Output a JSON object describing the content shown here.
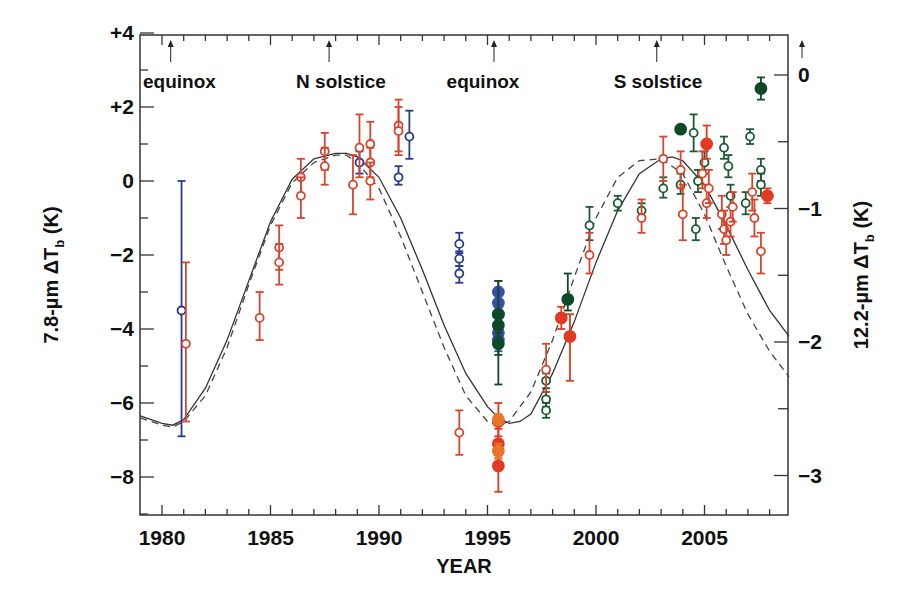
{
  "chart_data": {
    "type": "scatter",
    "title": "",
    "xlabel": "YEAR",
    "ylabel": "7.8-µm ΔT_b (K)",
    "ylabel_right": "12.2-µm ΔT_b (K)",
    "xlim": [
      1979,
      2008.9
    ],
    "ylim": [
      -9,
      4
    ],
    "ylim_right": [
      -3.3,
      0.3
    ],
    "grid": false,
    "legend": null,
    "x_ticks": [
      1980,
      1985,
      1990,
      1995,
      2000,
      2005
    ],
    "x_tick_labels": [
      "1980",
      "1985",
      "1990",
      "1995",
      "2000",
      "2005"
    ],
    "y_ticks": [
      4,
      2,
      0,
      -2,
      -4,
      -6,
      -8
    ],
    "y_tick_labels": [
      "+4",
      "+2",
      "0",
      "-2",
      "-4",
      "-6",
      "-8"
    ],
    "y_right_ticks": [
      0,
      -1,
      -2,
      -3
    ],
    "y_right_tick_labels": [
      "0",
      "-1",
      "-2",
      "-3"
    ],
    "annotations": [
      {
        "text": "equinox",
        "x": 1980.4,
        "arrow_x": 1980.4
      },
      {
        "text": "N solstice",
        "x": 1987.7,
        "arrow_x": 1987.7
      },
      {
        "text": "equinox",
        "x": 1995.3,
        "arrow_x": 1995.3
      },
      {
        "text": "S solstice",
        "x": 2002.8,
        "arrow_x": 2002.8
      }
    ],
    "curves": [
      {
        "name": "model-solid",
        "style": "solid",
        "color": "#333333",
        "x": [
          1979.0,
          1980.0,
          1980.5,
          1981.0,
          1982.0,
          1983.0,
          1984.0,
          1985.0,
          1986.0,
          1987.0,
          1988.0,
          1988.5,
          1989.0,
          1990.0,
          1991.0,
          1992.0,
          1993.0,
          1994.0,
          1995.0,
          1995.5,
          1996.0,
          1996.5,
          1997.0,
          1998.0,
          1999.0,
          2000.0,
          2001.0,
          2002.0,
          2003.0,
          2003.5,
          2004.0,
          2005.0,
          2006.0,
          2007.0,
          2008.0,
          2008.9
        ],
        "y": [
          -6.35,
          -6.55,
          -6.6,
          -6.45,
          -5.6,
          -4.3,
          -2.7,
          -1.1,
          0.05,
          0.6,
          0.75,
          0.75,
          0.65,
          0.1,
          -1.0,
          -2.4,
          -3.9,
          -5.2,
          -6.1,
          -6.4,
          -6.55,
          -6.5,
          -6.3,
          -5.2,
          -3.8,
          -2.2,
          -0.8,
          0.2,
          0.6,
          0.65,
          0.55,
          -0.1,
          -1.2,
          -2.4,
          -3.5,
          -4.2
        ]
      },
      {
        "name": "model-dashed",
        "style": "dashed",
        "color": "#444444",
        "x": [
          1979.0,
          1980.0,
          1980.5,
          1981.0,
          1982.0,
          1983.0,
          1984.0,
          1985.0,
          1986.0,
          1987.0,
          1988.0,
          1988.5,
          1989.0,
          1990.0,
          1991.0,
          1992.0,
          1993.0,
          1994.0,
          1995.0,
          1995.5,
          1996.0,
          1997.0,
          1998.0,
          1999.0,
          2000.0,
          2001.0,
          2002.0,
          2003.0,
          2004.0,
          2005.0,
          2006.0,
          2007.0,
          2008.0,
          2008.9
        ],
        "y": [
          -6.4,
          -6.6,
          -6.65,
          -6.5,
          -5.8,
          -4.5,
          -2.8,
          -1.2,
          -0.05,
          0.5,
          0.7,
          0.7,
          0.5,
          -0.2,
          -1.5,
          -3.0,
          -4.5,
          -5.8,
          -6.5,
          -6.6,
          -6.5,
          -5.7,
          -4.3,
          -2.6,
          -1.0,
          0.1,
          0.55,
          0.6,
          0.2,
          -0.9,
          -2.3,
          -3.6,
          -4.6,
          -5.3
        ]
      }
    ],
    "series": [
      {
        "name": "blue-open",
        "color": "#2a3a8c",
        "marker": "open-circle",
        "points": [
          {
            "x": 1980.9,
            "y": -3.5,
            "lo": -6.9,
            "hi": 0.0
          },
          {
            "x": 1989.1,
            "y": 0.5,
            "lo": 0.2,
            "hi": 0.8
          },
          {
            "x": 1990.9,
            "y": 0.1,
            "lo": -0.1,
            "hi": 0.4
          },
          {
            "x": 1991.4,
            "y": 1.2,
            "lo": 0.6,
            "hi": 1.9
          },
          {
            "x": 1993.7,
            "y": -1.7,
            "lo": -1.95,
            "hi": -1.4
          },
          {
            "x": 1993.7,
            "y": -2.1,
            "lo": -2.3,
            "hi": -1.9
          },
          {
            "x": 1993.7,
            "y": -2.5,
            "lo": -2.75,
            "hi": -2.3
          }
        ]
      },
      {
        "name": "blue-filled",
        "color": "#3a4fa8",
        "marker": "filled-circle",
        "points": [
          {
            "x": 1995.5,
            "y": -3.0,
            "lo": -3.3,
            "hi": -2.7
          },
          {
            "x": 1995.5,
            "y": -3.3,
            "lo": -3.6,
            "hi": -3.0
          },
          {
            "x": 1995.5,
            "y": -3.6,
            "lo": -3.9,
            "hi": -3.3
          },
          {
            "x": 1995.5,
            "y": -4.1,
            "lo": -4.4,
            "hi": -3.8
          },
          {
            "x": 1995.5,
            "y": -4.3,
            "lo": -4.6,
            "hi": -4.0
          }
        ]
      },
      {
        "name": "green-filled",
        "color": "#0f4a28",
        "marker": "filled-circle",
        "points": [
          {
            "x": 1995.5,
            "y": -3.6,
            "lo": -5.5,
            "hi": -2.7
          },
          {
            "x": 1995.5,
            "y": -3.9,
            "lo": -4.2,
            "hi": -3.6
          },
          {
            "x": 1995.5,
            "y": -4.4,
            "lo": -4.7,
            "hi": -4.1
          },
          {
            "x": 1998.7,
            "y": -3.2,
            "lo": -3.5,
            "hi": -2.5
          },
          {
            "x": 2003.9,
            "y": 1.4,
            "lo": 1.3,
            "hi": 1.5
          },
          {
            "x": 2007.6,
            "y": 2.5,
            "lo": 2.2,
            "hi": 2.8
          }
        ]
      },
      {
        "name": "green-open",
        "color": "#1d5a34",
        "marker": "open-circle",
        "points": [
          {
            "x": 1997.7,
            "y": -5.4,
            "lo": -5.6,
            "hi": -5.2
          },
          {
            "x": 1997.7,
            "y": -5.9,
            "lo": -6.1,
            "hi": -5.7
          },
          {
            "x": 1997.7,
            "y": -6.2,
            "lo": -6.4,
            "hi": -6.0
          },
          {
            "x": 1999.7,
            "y": -1.2,
            "lo": -1.6,
            "hi": -0.7
          },
          {
            "x": 2001.0,
            "y": -0.6,
            "lo": -0.8,
            "hi": -0.4
          },
          {
            "x": 2002.1,
            "y": -0.8,
            "lo": -1.0,
            "hi": -0.6
          },
          {
            "x": 2003.1,
            "y": -0.2,
            "lo": -0.45,
            "hi": 0.1
          },
          {
            "x": 2003.9,
            "y": -0.1,
            "lo": -0.35,
            "hi": 0.2
          },
          {
            "x": 2004.5,
            "y": 1.3,
            "lo": 0.8,
            "hi": 1.8
          },
          {
            "x": 2004.6,
            "y": -1.3,
            "lo": -1.6,
            "hi": -1.0
          },
          {
            "x": 2004.7,
            "y": 0.0,
            "lo": -0.3,
            "hi": 0.3
          },
          {
            "x": 2005.0,
            "y": 0.5,
            "lo": 0.2,
            "hi": 0.8
          },
          {
            "x": 2005.9,
            "y": 0.9,
            "lo": 0.6,
            "hi": 1.2
          },
          {
            "x": 2006.1,
            "y": 0.4,
            "lo": 0.1,
            "hi": 0.7
          },
          {
            "x": 2006.2,
            "y": -0.4,
            "lo": -0.7,
            "hi": -0.1
          },
          {
            "x": 2006.9,
            "y": -0.6,
            "lo": -0.9,
            "hi": -0.3
          },
          {
            "x": 2007.1,
            "y": 1.2,
            "lo": 1.0,
            "hi": 1.4
          },
          {
            "x": 2007.6,
            "y": 0.3,
            "lo": 0.0,
            "hi": 0.6
          },
          {
            "x": 2007.6,
            "y": -0.1,
            "lo": -0.4,
            "hi": 0.2
          }
        ]
      },
      {
        "name": "red-open",
        "color": "#d8452e",
        "marker": "open-circle",
        "points": [
          {
            "x": 1981.1,
            "y": -4.4,
            "lo": -6.5,
            "hi": -2.2
          },
          {
            "x": 1984.5,
            "y": -3.7,
            "lo": -4.3,
            "hi": -3.0
          },
          {
            "x": 1985.4,
            "y": -1.8,
            "lo": -2.4,
            "hi": -1.2
          },
          {
            "x": 1985.4,
            "y": -2.2,
            "lo": -2.8,
            "hi": -1.7
          },
          {
            "x": 1986.4,
            "y": 0.1,
            "lo": -0.4,
            "hi": 0.6
          },
          {
            "x": 1986.4,
            "y": -0.4,
            "lo": -1.0,
            "hi": 0.1
          },
          {
            "x": 1987.5,
            "y": 0.8,
            "lo": 0.3,
            "hi": 1.3
          },
          {
            "x": 1987.5,
            "y": 0.4,
            "lo": -0.1,
            "hi": 0.9
          },
          {
            "x": 1988.8,
            "y": -0.1,
            "lo": -0.9,
            "hi": 0.7
          },
          {
            "x": 1989.1,
            "y": 0.9,
            "lo": 0.1,
            "hi": 1.8
          },
          {
            "x": 1989.6,
            "y": 1.0,
            "lo": 0.5,
            "hi": 1.6
          },
          {
            "x": 1989.6,
            "y": 0.5,
            "lo": 0.1,
            "hi": 0.9
          },
          {
            "x": 1989.6,
            "y": 0.0,
            "lo": -0.5,
            "hi": 0.5
          },
          {
            "x": 1990.9,
            "y": 1.5,
            "lo": 0.8,
            "hi": 2.2
          },
          {
            "x": 1990.9,
            "y": 1.35,
            "lo": 0.7,
            "hi": 2.0
          },
          {
            "x": 1993.7,
            "y": -6.8,
            "lo": -7.4,
            "hi": -6.2
          },
          {
            "x": 1997.7,
            "y": -5.1,
            "lo": -5.7,
            "hi": -4.4
          },
          {
            "x": 1999.7,
            "y": -2.0,
            "lo": -2.5,
            "hi": -1.4
          },
          {
            "x": 2002.1,
            "y": -1.0,
            "lo": -1.4,
            "hi": -0.5
          },
          {
            "x": 2003.1,
            "y": 0.6,
            "lo": 0.0,
            "hi": 1.2
          },
          {
            "x": 2003.9,
            "y": 0.3,
            "lo": -0.2,
            "hi": 0.8
          },
          {
            "x": 2004.0,
            "y": -0.9,
            "lo": -1.6,
            "hi": -0.1
          },
          {
            "x": 2004.9,
            "y": 0.2,
            "lo": -0.2,
            "hi": 0.8
          },
          {
            "x": 2005.1,
            "y": -0.6,
            "lo": -1.0,
            "hi": -0.1
          },
          {
            "x": 2005.2,
            "y": -0.2,
            "lo": -0.6,
            "hi": 0.3
          },
          {
            "x": 2005.8,
            "y": -0.9,
            "lo": -1.3,
            "hi": -0.4
          },
          {
            "x": 2005.9,
            "y": -1.3,
            "lo": -1.7,
            "hi": -0.8
          },
          {
            "x": 2006.0,
            "y": -1.6,
            "lo": -2.0,
            "hi": -1.1
          },
          {
            "x": 2006.2,
            "y": -1.1,
            "lo": -1.5,
            "hi": -0.7
          },
          {
            "x": 2006.3,
            "y": -0.7,
            "lo": -1.1,
            "hi": -0.3
          },
          {
            "x": 2007.2,
            "y": -0.3,
            "lo": -0.8,
            "hi": 0.2
          },
          {
            "x": 2007.3,
            "y": -1.0,
            "lo": -1.5,
            "hi": -0.5
          },
          {
            "x": 2007.6,
            "y": -1.9,
            "lo": -2.5,
            "hi": -1.4
          }
        ]
      },
      {
        "name": "red-filled",
        "color": "#e03a22",
        "marker": "filled-circle",
        "points": [
          {
            "x": 1995.5,
            "y": -6.5,
            "lo": -6.9,
            "hi": -6.0
          },
          {
            "x": 1995.5,
            "y": -7.1,
            "lo": -7.5,
            "hi": -6.7
          },
          {
            "x": 1995.5,
            "y": -7.7,
            "lo": -8.4,
            "hi": -7.2
          },
          {
            "x": 1998.4,
            "y": -3.7,
            "lo": -4.0,
            "hi": -3.4
          },
          {
            "x": 1998.8,
            "y": -4.2,
            "lo": -5.4,
            "hi": -3.6
          },
          {
            "x": 2005.1,
            "y": 1.0,
            "lo": 0.6,
            "hi": 1.5
          },
          {
            "x": 2007.9,
            "y": -0.4,
            "lo": -0.6,
            "hi": -0.2
          }
        ]
      },
      {
        "name": "orange-filled",
        "color": "#e8762a",
        "marker": "filled-circle",
        "points": [
          {
            "x": 1995.5,
            "y": -6.45,
            "lo": -6.6,
            "hi": -6.3
          },
          {
            "x": 1995.5,
            "y": -7.3,
            "lo": -7.5,
            "hi": -7.1
          }
        ]
      }
    ]
  },
  "labels": {
    "xlabel": "YEAR",
    "ylabel_left_main": "7.8-µm ΔT",
    "ylabel_left_sub": "b",
    "ylabel_left_unit": " (K)",
    "ylabel_right_main": "12.2-µm ΔT",
    "ylabel_right_sub": "b",
    "ylabel_right_unit": " (K)"
  }
}
